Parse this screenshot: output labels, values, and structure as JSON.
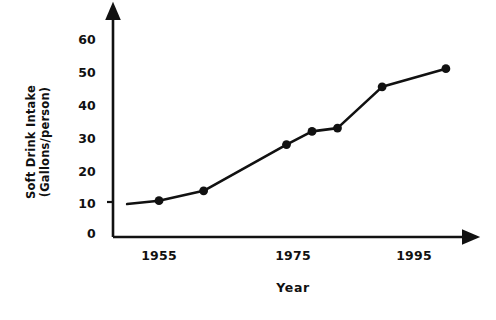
{
  "chart_data": {
    "type": "line",
    "title": "",
    "xlabel": "Year",
    "ylabel": "Soft Drink Intake (Gallons/person)",
    "ylabel_line1": "Soft Drink Intake",
    "ylabel_line2": "(Gallons/person)",
    "x": [
      1950,
      1955,
      1962,
      1975,
      1979,
      1983,
      1990,
      2000
    ],
    "values": [
      10,
      11,
      14,
      28,
      32,
      33,
      45.5,
      51
    ],
    "series": [
      {
        "name": "Soft Drink Intake",
        "values": [
          10,
          11,
          14,
          28,
          32,
          33,
          45.5,
          51
        ]
      }
    ],
    "marker_years": [
      1955,
      1962,
      1975,
      1979,
      1983,
      1990,
      2000
    ],
    "xlim": [
      1948,
      2004
    ],
    "ylim": [
      0,
      66
    ],
    "xticks": [
      1955,
      1975,
      1995
    ],
    "xtick_labels": [
      "1955",
      "1975",
      "1995"
    ],
    "yticks": [
      0,
      10,
      20,
      30,
      40,
      50,
      60
    ],
    "ytick_labels": [
      "0",
      "10",
      "20",
      "30",
      "40",
      "50",
      "60"
    ],
    "grid": false,
    "legend": false,
    "legend_position": "none",
    "line_color": "#111111",
    "marker_color": "#111111",
    "axis_color": "#111111",
    "background_color": "#ffffff",
    "axis_style": "arrow-tipped L-axes"
  }
}
